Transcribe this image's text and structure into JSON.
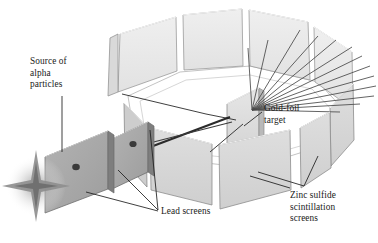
{
  "figure": {
    "background_color": "#ffffff"
  },
  "labels": {
    "source": "Source of\nalpha\nparticles",
    "gold_foil": "Gold-foil\ntarget",
    "lead_screens": "Lead screens",
    "zinc_sulfide": "Zinc sulfide\nscintillation\nscreens"
  },
  "colors": {
    "panel_outer_face": "#d6d6d6",
    "panel_inner_face": "#e9e9e9",
    "panel_edge": "#8f8f8f",
    "panel_top_edge": "#f2f2f2",
    "lead_screen_face": "#a9a9a9",
    "lead_screen_side": "#7c7c7c",
    "lead_screen_hole": "#3a3a3a",
    "gold_foil_face": "#dedede",
    "gold_foil_side": "#b4b4b4",
    "beam_line": "#2b2b2b",
    "scatter_ray": "#4a4a4a",
    "leader_line": "#1e1e1e",
    "floor_outline": "#b0b0b0",
    "star_glow": "#c9c9c9",
    "text": "#1a1a1a"
  },
  "apparatus": {
    "detector_ring": {
      "name": "zinc sulfide scintillation screen ring",
      "panel_count": 10,
      "arrangement": "circular ring of flat rectangular panels in perspective"
    },
    "lead_screens": {
      "count": 2,
      "feature": "collimating hole in each plate"
    },
    "alpha_source": {
      "glyph": "four-pointed sparkle star"
    },
    "gold_foil": {
      "name": "gold-foil target",
      "position": "center of ring"
    },
    "beam": {
      "incoming_rays": 1,
      "scattered_rays": 12
    }
  }
}
